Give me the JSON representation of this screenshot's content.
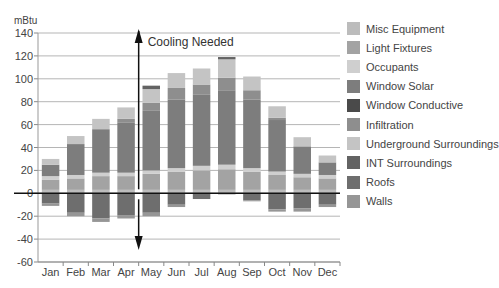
{
  "chart_data": {
    "type": "bar",
    "stacked": true,
    "title": "",
    "ylabel": "mBtu",
    "xlabel": "",
    "ylim": [
      -60,
      140
    ],
    "yticks": [
      140,
      120,
      100,
      80,
      60,
      40,
      20,
      0,
      -20,
      -40,
      -60
    ],
    "grid": true,
    "legend_position": "right",
    "annotation": {
      "text": "Cooling Needed",
      "x_between": [
        "Apr",
        "May"
      ],
      "type": "double-arrow"
    },
    "categories": [
      "Jan",
      "Feb",
      "Mar",
      "Apr",
      "May",
      "Jun",
      "Jul",
      "Aug",
      "Sep",
      "Oct",
      "Nov",
      "Dec"
    ],
    "series": [
      {
        "name": "Misc Equipment",
        "color": "#bcbcbc",
        "values": [
          3,
          3,
          3,
          3,
          3,
          3,
          3,
          3,
          3,
          3,
          3,
          3
        ]
      },
      {
        "name": "Light Fixtures",
        "color": "#a3a3a3",
        "values": [
          9,
          10,
          12,
          12,
          14,
          16,
          17,
          18,
          16,
          13,
          11,
          10
        ]
      },
      {
        "name": "Occupants",
        "color": "#cfcfcf",
        "values": [
          3,
          3,
          3,
          3,
          3,
          3,
          4,
          4,
          3,
          3,
          3,
          3
        ]
      },
      {
        "name": "Window Solar",
        "color": "#7d7d7d",
        "values": [
          10,
          27,
          38,
          44,
          52,
          60,
          62,
          65,
          60,
          45,
          24,
          11
        ]
      },
      {
        "name": "Window Conductive",
        "color": "#4a4a4a",
        "values": [
          0,
          0,
          0,
          0,
          0,
          0,
          0,
          0,
          0,
          0,
          0,
          0
        ]
      },
      {
        "name": "Infiltration",
        "color": "#8e8e8e",
        "values": [
          0,
          0,
          0,
          3,
          7,
          10,
          9,
          11,
          8,
          2,
          0,
          0
        ]
      },
      {
        "name": "Underground Surroundings",
        "color": "#c4c4c4",
        "values": [
          5,
          7,
          9,
          10,
          12,
          13,
          14,
          16,
          12,
          10,
          8,
          6
        ]
      },
      {
        "name": "INT Surroundings",
        "color": "#636363",
        "values": [
          0,
          0,
          0,
          0,
          3,
          0,
          0,
          2,
          0,
          0,
          0,
          0
        ]
      },
      {
        "name": "Roofs",
        "color": "#6e6e6e",
        "values": [
          -9,
          -17,
          -22,
          -19,
          -17,
          -10,
          -5,
          0,
          -6,
          -14,
          -13,
          -10
        ]
      },
      {
        "name": "Walls",
        "color": "#969696",
        "values": [
          -2,
          -3,
          -3,
          -3,
          -3,
          -2,
          0,
          -1,
          -1,
          -2,
          -3,
          -2
        ]
      }
    ],
    "totals_positive": [
      30,
      50,
      67,
      75,
      94,
      103,
      106,
      118,
      100,
      76,
      50,
      36
    ],
    "totals_negative": [
      -11,
      -20,
      -25,
      -22,
      -20,
      -12,
      -5,
      -1,
      -7,
      -16,
      -16,
      -12
    ]
  },
  "legend": [
    {
      "label": "Misc Equipment",
      "color": "#bcbcbc"
    },
    {
      "label": "Light Fixtures",
      "color": "#a3a3a3"
    },
    {
      "label": "Occupants",
      "color": "#cfcfcf"
    },
    {
      "label": "Window Solar",
      "color": "#7d7d7d"
    },
    {
      "label": "Window Conductive",
      "color": "#4a4a4a"
    },
    {
      "label": "Infiltration",
      "color": "#8e8e8e"
    },
    {
      "label": "Underground Surroundings",
      "color": "#c4c4c4"
    },
    {
      "label": "INT Surroundings",
      "color": "#636363"
    },
    {
      "label": "Roofs",
      "color": "#6e6e6e"
    },
    {
      "label": "Walls",
      "color": "#969696"
    }
  ],
  "axis": {
    "unit_label": "mBtu",
    "annotation_text": "Cooling Needed"
  }
}
